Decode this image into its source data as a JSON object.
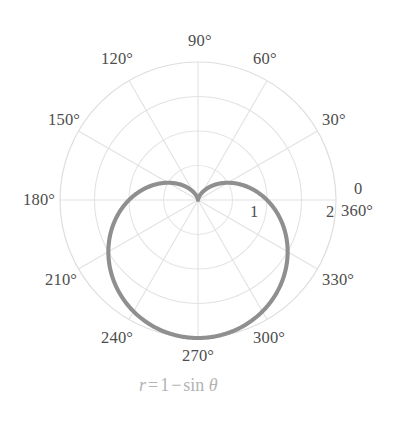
{
  "chart_data": {
    "type": "line",
    "subtype": "polar",
    "title": "",
    "caption": "r = 1 - sin θ",
    "equation": {
      "lhs": "r",
      "equals": "=",
      "const": "1",
      "minus": "−",
      "fn": "sin",
      "var": "θ"
    },
    "curve_color": "#8f8f8f",
    "grid_color": "#e2e2e2",
    "label_color": "#4d4d4d",
    "caption_color": "#b3b3b3",
    "background": "#ffffff",
    "grid": true,
    "legend": "none",
    "theta_unit": "degrees",
    "theta_tick_step": 30,
    "r_range": [
      0,
      2
    ],
    "r_ticks": [
      0.5,
      1.0,
      1.5,
      2.0
    ],
    "r_tick_labels": [
      "",
      "1",
      "",
      "2"
    ],
    "angle_labels": [
      {
        "value": 0,
        "text": "0"
      },
      {
        "value": 360,
        "text": "360°"
      },
      {
        "value": 30,
        "text": "30°"
      },
      {
        "value": 60,
        "text": "60°"
      },
      {
        "value": 90,
        "text": "90°"
      },
      {
        "value": 120,
        "text": "120°"
      },
      {
        "value": 150,
        "text": "150°"
      },
      {
        "value": 180,
        "text": "180°"
      },
      {
        "value": 210,
        "text": "210°"
      },
      {
        "value": 240,
        "text": "240°"
      },
      {
        "value": 270,
        "text": "270°"
      },
      {
        "value": 300,
        "text": "300°"
      },
      {
        "value": 330,
        "text": "330°"
      }
    ],
    "theta": [
      0,
      15,
      30,
      45,
      60,
      75,
      90,
      105,
      120,
      135,
      150,
      165,
      180,
      195,
      210,
      225,
      240,
      255,
      270,
      285,
      300,
      315,
      330,
      345,
      360
    ],
    "r": [
      1.0,
      0.741,
      0.5,
      0.293,
      0.134,
      0.034,
      0.0,
      0.034,
      0.134,
      0.293,
      0.5,
      0.741,
      1.0,
      1.259,
      1.5,
      1.707,
      1.866,
      1.966,
      2.0,
      1.966,
      1.866,
      1.707,
      1.5,
      1.259,
      1.0
    ],
    "notable_points": [
      {
        "theta": 90,
        "r": 0,
        "note": "cusp at pole"
      },
      {
        "theta": 270,
        "r": 2,
        "note": "maximum"
      },
      {
        "theta": 0,
        "r": 1
      },
      {
        "theta": 180,
        "r": 1
      }
    ]
  },
  "labels": {
    "deg_0": "0",
    "deg_360": "360°",
    "deg_30": "30°",
    "deg_60": "60°",
    "deg_90": "90°",
    "deg_120": "120°",
    "deg_150": "150°",
    "deg_180": "180°",
    "deg_210": "210°",
    "deg_240": "240°",
    "deg_270": "270°",
    "deg_300": "300°",
    "deg_330": "330°",
    "r_one": "1",
    "r_two": "2"
  }
}
